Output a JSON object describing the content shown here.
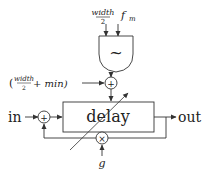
{
  "diagram": {
    "inputs": {
      "width_half_num": "width",
      "width_half_den": "2",
      "fm": "f",
      "fm_sub": "m",
      "offset_open": "(",
      "offset_num": "width",
      "offset_den": "2",
      "offset_rest": "+ min)",
      "gain": "g"
    },
    "blocks": {
      "oscillator_symbol": "~",
      "sum_symbol": "+",
      "mult_symbol": "×",
      "delay_label": "delay"
    },
    "io": {
      "in_label": "in",
      "out_label": "out"
    },
    "colors": {
      "stroke": "#333333",
      "text": "#222222",
      "background": "#ffffff"
    }
  }
}
